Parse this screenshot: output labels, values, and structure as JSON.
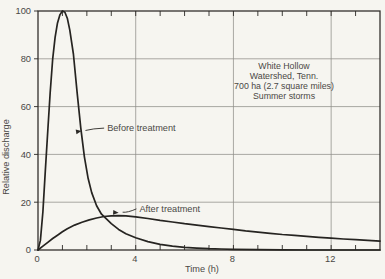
{
  "colors": {
    "background": "#f6f5f0",
    "ink": "#2b2926",
    "curve": "#262421",
    "grid": "#8f8d88",
    "text": "#4a4845"
  },
  "chart_data": {
    "type": "line",
    "title": "",
    "xlabel": "Time (h)",
    "ylabel": "Relative discharge",
    "xlim": [
      0,
      14
    ],
    "ylim": [
      0,
      100
    ],
    "x_major_ticks": [
      0,
      4,
      8,
      12
    ],
    "x_tick_labels": [
      "0",
      "4",
      "8",
      "12"
    ],
    "x_minor_tick_interval": 1,
    "y_major_ticks": [
      0,
      20,
      40,
      60,
      80,
      100
    ],
    "y_tick_labels": [
      "0",
      "20",
      "40",
      "60",
      "80",
      "100"
    ],
    "grid": {
      "x": [
        4,
        8,
        12
      ],
      "y": [
        20,
        40,
        60,
        80
      ]
    },
    "legend_position": "none",
    "annotation_lines": [
      "White Hollow",
      "Watershed, Tenn.",
      "700 ha (2.7 square miles)",
      "Summer storms"
    ],
    "series": [
      {
        "name": "Before treatment",
        "points": [
          [
            0,
            0
          ],
          [
            0.1,
            4
          ],
          [
            0.2,
            16
          ],
          [
            0.3,
            33
          ],
          [
            0.4,
            50
          ],
          [
            0.5,
            66
          ],
          [
            0.6,
            80
          ],
          [
            0.7,
            89
          ],
          [
            0.8,
            95
          ],
          [
            0.9,
            98.5
          ],
          [
            1.0,
            100
          ],
          [
            1.1,
            99.5
          ],
          [
            1.2,
            97
          ],
          [
            1.3,
            92
          ],
          [
            1.45,
            82
          ],
          [
            1.6,
            66
          ],
          [
            1.75,
            51
          ],
          [
            1.9,
            39
          ],
          [
            2.05,
            30
          ],
          [
            2.2,
            24
          ],
          [
            2.4,
            18.5
          ],
          [
            2.6,
            15
          ],
          [
            2.8,
            13
          ],
          [
            3.0,
            11
          ],
          [
            3.3,
            8.6
          ],
          [
            3.6,
            6.8
          ],
          [
            4.0,
            5.1
          ],
          [
            4.5,
            3.5
          ],
          [
            5.0,
            2.4
          ],
          [
            5.5,
            1.6
          ],
          [
            6.0,
            1.1
          ],
          [
            6.5,
            0.8
          ],
          [
            7.0,
            0.55
          ],
          [
            7.5,
            0.4
          ],
          [
            8.0,
            0.28
          ],
          [
            9.0,
            0.14
          ],
          [
            10.0,
            0.06
          ],
          [
            11.0,
            0.02
          ],
          [
            12.0,
            0.0
          ],
          [
            14.0,
            0.0
          ]
        ]
      },
      {
        "name": "After treatment",
        "points": [
          [
            0,
            0
          ],
          [
            0.2,
            1.6
          ],
          [
            0.4,
            3.2
          ],
          [
            0.6,
            4.8
          ],
          [
            0.8,
            6.2
          ],
          [
            1.0,
            7.6
          ],
          [
            1.2,
            8.9
          ],
          [
            1.5,
            10.4
          ],
          [
            1.8,
            11.6
          ],
          [
            2.1,
            12.6
          ],
          [
            2.4,
            13.4
          ],
          [
            2.7,
            14.0
          ],
          [
            3.0,
            14.3
          ],
          [
            3.3,
            14.4
          ],
          [
            3.6,
            14.3
          ],
          [
            4.0,
            13.9
          ],
          [
            4.5,
            13.2
          ],
          [
            5.0,
            12.4
          ],
          [
            5.5,
            11.7
          ],
          [
            6.0,
            11.0
          ],
          [
            6.5,
            10.4
          ],
          [
            7.0,
            9.8
          ],
          [
            7.5,
            9.2
          ],
          [
            8.0,
            8.6
          ],
          [
            8.5,
            8.0
          ],
          [
            9.0,
            7.5
          ],
          [
            9.5,
            7.0
          ],
          [
            10.0,
            6.5
          ],
          [
            10.5,
            6.1
          ],
          [
            11.0,
            5.7
          ],
          [
            11.5,
            5.3
          ],
          [
            12.0,
            4.95
          ],
          [
            12.5,
            4.6
          ],
          [
            13.0,
            4.3
          ],
          [
            13.5,
            4.0
          ],
          [
            14.0,
            3.7
          ]
        ]
      }
    ],
    "callouts": [
      {
        "text": "Before treatment",
        "text_t": 2.83,
        "text_v": 51.0,
        "tip_t": 1.78,
        "tip_v": 49.8,
        "bend": -1
      },
      {
        "text": "After treatment",
        "text_t": 4.15,
        "text_v": 17.2,
        "tip_t": 3.3,
        "tip_v": 15.6,
        "bend": 2
      }
    ]
  }
}
